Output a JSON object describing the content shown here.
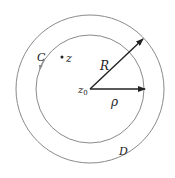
{
  "diagram": {
    "type": "annulus-diagram",
    "center": {
      "x": 90,
      "y": 89
    },
    "inner_circle": {
      "radius": 54,
      "label": "C",
      "color": "#8a8a8a"
    },
    "outer_circle": {
      "radius": 74,
      "label": "D",
      "color": "#8a8a8a"
    },
    "labels": {
      "C": "C",
      "z": "z",
      "z0_main": "z",
      "z0_sub": "0",
      "R": "R",
      "rho": "ρ",
      "D": "D"
    },
    "arrows": {
      "R": {
        "from": [
          90,
          89
        ],
        "to": [
          143,
          39
        ],
        "label": "R"
      },
      "rho": {
        "from": [
          90,
          89
        ],
        "to": [
          145,
          89
        ],
        "label": "ρ"
      }
    },
    "point_z": {
      "x": 62,
      "y": 57
    },
    "line_color": "#222222"
  }
}
